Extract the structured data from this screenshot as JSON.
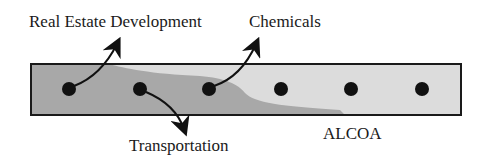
{
  "diagram": {
    "labels": {
      "real_estate": "Real Estate Development",
      "chemicals": "Chemicals",
      "transportation": "Transportation",
      "company": "ALCOA"
    },
    "colors": {
      "bar_light": "#dcdcdc",
      "bar_dark": "#a8a8a8",
      "outline": "#1a1a1a",
      "dot": "#111111"
    },
    "dot_count": 6
  }
}
